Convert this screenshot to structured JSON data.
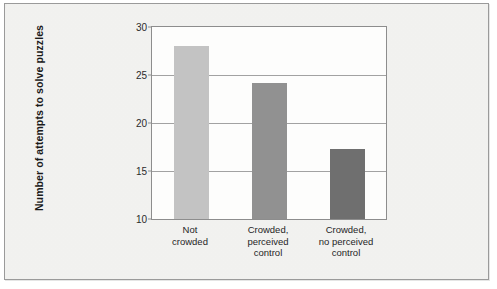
{
  "chart_data": {
    "type": "bar",
    "title": "",
    "subtitle": "",
    "xlabel": "",
    "ylabel": "Number of attempts to solve puzzles",
    "categories": [
      "Not crowded",
      "Crowded, perceived control",
      "Crowded, no perceived control"
    ],
    "category_lines": [
      [
        "Not",
        "crowded"
      ],
      [
        "Crowded,",
        "perceived",
        "control"
      ],
      [
        "Crowded,",
        "no perceived",
        "control"
      ]
    ],
    "values": [
      28.0,
      24.2,
      17.3
    ],
    "bar_colors": [
      "#c3c3c3",
      "#919191",
      "#6f6f6f"
    ],
    "ylim": [
      10,
      30
    ],
    "yticks": [
      10,
      15,
      20,
      25,
      30
    ],
    "ytick_labels": [
      "10",
      "15",
      "20",
      "25",
      "30"
    ],
    "gridlines": [
      15,
      20,
      25
    ],
    "grid": true,
    "legend": false,
    "legend_position": "none",
    "annotations": []
  },
  "figure": {
    "frame_border_color": "#9a9a9a",
    "background_color": "#f3f3f1",
    "plot_background_color": "#fdfdfc",
    "axis_color": "#8d8d8d",
    "grid_color": "#a2a2a2",
    "text_color": "#1a1a1a"
  }
}
